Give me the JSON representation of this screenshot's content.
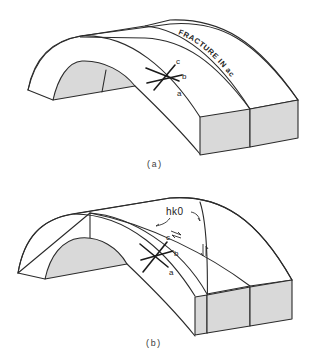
{
  "figures": [
    {
      "id": "a",
      "caption": "(a)",
      "description": "Folded layer (anticline) with a fracture lying in the ac plane",
      "annotation": "FRACTURE IN ac",
      "axes": {
        "a": "a",
        "b": "b",
        "c": "c"
      }
    },
    {
      "id": "b",
      "caption": "(b)",
      "description": "Folded layer with hk0 shear fractures showing slip directions",
      "annotation": "hk0",
      "axes": {
        "a": "a",
        "b": "b",
        "c": "c"
      }
    }
  ],
  "colors": {
    "line": "#2b2b2b",
    "shaded_face": "#d9d9d9",
    "background": "#ffffff"
  }
}
